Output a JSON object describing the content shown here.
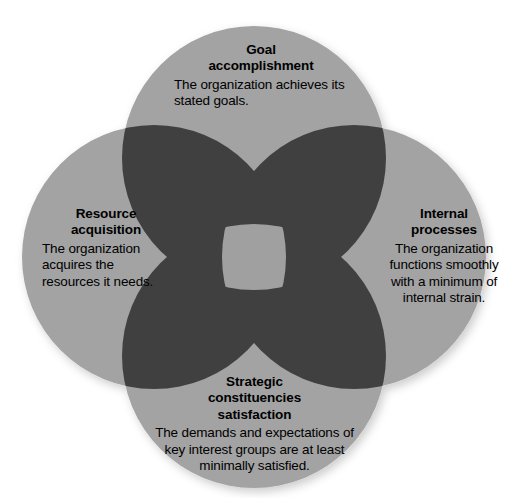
{
  "figure": {
    "kind": "four-circle-venn-diagram",
    "background_color": "#ffffff",
    "circle_fill": "#a3a3a3",
    "pair_overlap_fill": "#404040",
    "center_overlap_fill": "#a0a0a0",
    "text_color": "#000000"
  },
  "circles": [
    {
      "id": "goal",
      "position": "top",
      "cx": 254,
      "cy": 158,
      "r": 132,
      "title": "Goal\naccomplishment",
      "title_line1": "Goal",
      "title_line2": "accomplishment",
      "body": "The organization achieves its stated goals."
    },
    {
      "id": "internal",
      "position": "right",
      "cx": 354,
      "cy": 257,
      "r": 132,
      "title": "Internal\nprocesses",
      "title_line1": "Internal",
      "title_line2": "processes",
      "body": "The organization functions smoothly with a minimum of internal strain."
    },
    {
      "id": "strategic",
      "position": "bottom",
      "cx": 254,
      "cy": 356,
      "r": 132,
      "title": "Strategic\nconstituencies\nsatisfaction",
      "title_line1": "Strategic",
      "title_line2": "constituencies",
      "title_line3": "satisfaction",
      "body": "The demands and expectations of key interest groups are at least minimally satisfied."
    },
    {
      "id": "resource",
      "position": "left",
      "cx": 154,
      "cy": 257,
      "r": 132,
      "title": "Resource\nacquisition",
      "title_line1": "Resource",
      "title_line2": "acquisition",
      "body": "The organization acquires the resources it needs."
    }
  ],
  "labels": {
    "goal": {
      "title_line1": "Goal",
      "title_line2": "accomplishment",
      "body": "The organization achieves its stated goals."
    },
    "resource": {
      "title_line1": "Resource",
      "title_line2": "acquisition",
      "body": "The organization acquires the resources it needs."
    },
    "internal": {
      "title_line1": "Internal",
      "title_line2": "processes",
      "body": "The organization functions smoothly with a minimum of internal strain."
    },
    "strategic": {
      "title_line1": "Strategic",
      "title_line2": "constituencies",
      "title_line3": "satisfaction",
      "body": "The demands and expectations of key interest groups are at least minimally satisfied."
    }
  }
}
